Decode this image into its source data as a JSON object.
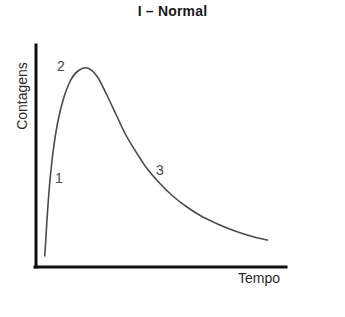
{
  "chart_data": {
    "type": "line",
    "title": "I – Normal",
    "xlabel": "Tempo",
    "ylabel": "Contagens",
    "grid": false,
    "legend": null,
    "axis_style": "open-lr-corner",
    "xlim": [
      0,
      100
    ],
    "ylim": [
      0,
      100
    ],
    "xticks": [],
    "yticks": [],
    "series": [
      {
        "name": "Contagens vs Tempo",
        "color": "#4a4a4a",
        "x": [
          2.0,
          2.4,
          3.0,
          4.0,
          5.5,
          7.5,
          10.0,
          13.0,
          16.0,
          20.0,
          24.0,
          28.0,
          32.0,
          36.0,
          40.0,
          45.0,
          50.0,
          56.0,
          62.0,
          68.0,
          74.0,
          80.0,
          86.0,
          92.0,
          96.0
        ],
        "values": [
          3.0,
          10.0,
          22.0,
          38.0,
          55.0,
          70.0,
          82.0,
          91.0,
          95.5,
          97.0,
          93.0,
          84.0,
          74.0,
          64.0,
          56.0,
          47.0,
          40.0,
          33.0,
          27.5,
          23.0,
          19.5,
          16.5,
          14.0,
          12.0,
          11.0
        ]
      }
    ],
    "annotations": [
      {
        "label": "1",
        "x": 9.0,
        "y": 41.0,
        "note": "rising limb"
      },
      {
        "label": "2",
        "x": 10.0,
        "y": 95.0,
        "note": "peak"
      },
      {
        "label": "3",
        "x": 50.0,
        "y": 45.0,
        "note": "decay tail"
      }
    ]
  },
  "figure": {
    "title": "I – Normal",
    "x_axis_label": "Tempo",
    "y_axis_label": "Contagens",
    "annotation_1": "1",
    "annotation_2": "2",
    "annotation_3": "3",
    "colors": {
      "background": "#ffffff",
      "axis": "#111111",
      "curve": "#4a4a4a",
      "title_text": "#1a1a1a",
      "label_text": "#2a2a2a"
    }
  }
}
